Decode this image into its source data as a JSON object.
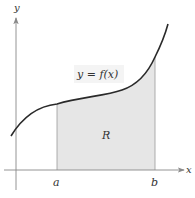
{
  "diagram": {
    "axis_labels": {
      "x": "x",
      "y": "y"
    },
    "equation": {
      "lhs": "y",
      "eq": " = ",
      "rhs": "f(x)"
    },
    "region_label": "R",
    "bounds": {
      "a": "a",
      "b": "b"
    },
    "colors": {
      "curve": "#2a2a2a",
      "axis": "#888888",
      "shade": "#e6e6e6",
      "label_box": "#f2f2f2"
    }
  }
}
